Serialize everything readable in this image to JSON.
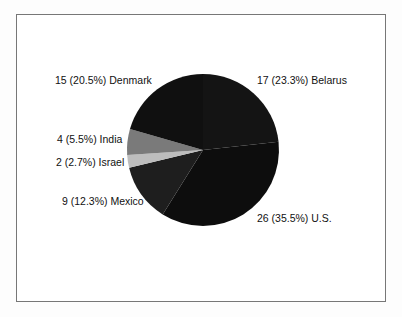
{
  "chart_data": {
    "type": "pie",
    "title": "",
    "start_angle_deg": 0,
    "direction": "clockwise",
    "slices": [
      {
        "label": "Belarus",
        "value": 17,
        "percent": 23.3,
        "text": "17 (23.3%) Belarus",
        "color": "#141414"
      },
      {
        "label": "U.S.",
        "value": 26,
        "percent": 35.5,
        "text": "26 (35.5%) U.S.",
        "color": "#0d0d0d"
      },
      {
        "label": "Mexico",
        "value": 9,
        "percent": 12.3,
        "text": "9 (12.3%) Mexico",
        "color": "#1e1e1e"
      },
      {
        "label": "Israel",
        "value": 2,
        "percent": 2.7,
        "text": "2 (2.7%) Israel",
        "color": "#bdbdbd"
      },
      {
        "label": "India",
        "value": 4,
        "percent": 5.5,
        "text": "4 (5.5%) India",
        "color": "#7a7a7a"
      },
      {
        "label": "Denmark",
        "value": 15,
        "percent": 20.5,
        "text": "15 (20.5%) Denmark",
        "color": "#101010"
      }
    ],
    "total": 73
  },
  "labels": {
    "denmark": "15 (20.5%) Denmark",
    "belarus": "17 (23.3%) Belarus",
    "india": "4 (5.5%) India",
    "israel": "2 (2.7%) Israel",
    "mexico": "9 (12.3%) Mexico",
    "us": "26 (35.5%) U.S."
  }
}
